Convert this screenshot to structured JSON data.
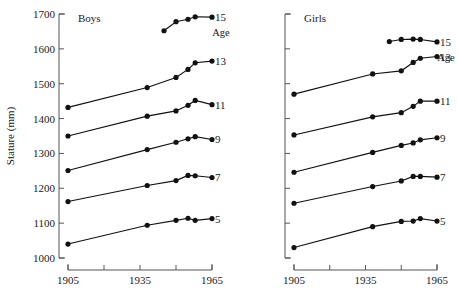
{
  "figure": {
    "y_axis_title": "Stature (mm)",
    "age_header": "Age"
  },
  "chart_data": {
    "type": "line",
    "xlabel": "",
    "ylabel": "Stature (mm)",
    "xlim": [
      1900,
      1968
    ],
    "ylim": [
      1000,
      1700
    ],
    "yticks": [
      1000,
      1100,
      1200,
      1300,
      1400,
      1500,
      1600,
      1700
    ],
    "ytick_labels": [
      "1000",
      "1100",
      "1200",
      "1300",
      "1400",
      "1500",
      "1600",
      "1700"
    ],
    "xticks": [
      1905,
      1920,
      1935,
      1950,
      1965
    ],
    "xtick_labels": [
      "1905",
      "",
      "1935",
      "",
      "1965"
    ],
    "grid": false,
    "legend_position": "right-of-series (age labels at line ends)",
    "panels": [
      {
        "name": "boys",
        "title": "Boys",
        "series": [
          {
            "name": "15",
            "age_label": "15",
            "x": [
              1945,
              1950,
              1955,
              1958,
              1965
            ],
            "y": [
              1652,
              1678,
              1685,
              1692,
              1691
            ]
          },
          {
            "name": "13",
            "age_label": "13",
            "x": [
              1905,
              1938,
              1950,
              1955,
              1958,
              1965
            ],
            "y": [
              1432,
              1489,
              1518,
              1541,
              1560,
              1565
            ]
          },
          {
            "name": "11",
            "age_label": "11",
            "x": [
              1905,
              1938,
              1950,
              1955,
              1958,
              1965
            ],
            "y": [
              1350,
              1407,
              1422,
              1438,
              1452,
              1440
            ]
          },
          {
            "name": "9",
            "age_label": "9",
            "x": [
              1905,
              1938,
              1950,
              1955,
              1958,
              1965
            ],
            "y": [
              1251,
              1311,
              1332,
              1342,
              1348,
              1340
            ]
          },
          {
            "name": "7",
            "age_label": "7",
            "x": [
              1905,
              1938,
              1950,
              1955,
              1958,
              1965
            ],
            "y": [
              1162,
              1208,
              1222,
              1237,
              1236,
              1231
            ]
          },
          {
            "name": "5",
            "age_label": "5",
            "x": [
              1905,
              1938,
              1950,
              1955,
              1958,
              1965
            ],
            "y": [
              1040,
              1094,
              1108,
              1114,
              1108,
              1113
            ]
          }
        ]
      },
      {
        "name": "girls",
        "title": "Girls",
        "series": [
          {
            "name": "15",
            "age_label": "15",
            "x": [
              1945,
              1950,
              1955,
              1958,
              1965
            ],
            "y": [
              1621,
              1627,
              1628,
              1627,
              1620
            ]
          },
          {
            "name": "13",
            "age_label": "13",
            "x": [
              1905,
              1938,
              1950,
              1955,
              1958,
              1965
            ],
            "y": [
              1470,
              1528,
              1537,
              1561,
              1573,
              1578
            ]
          },
          {
            "name": "11",
            "age_label": "11",
            "x": [
              1905,
              1938,
              1950,
              1955,
              1958,
              1965
            ],
            "y": [
              1353,
              1405,
              1417,
              1435,
              1450,
              1450
            ]
          },
          {
            "name": "9",
            "age_label": "9",
            "x": [
              1905,
              1938,
              1950,
              1955,
              1958,
              1965
            ],
            "y": [
              1246,
              1303,
              1323,
              1330,
              1339,
              1345
            ]
          },
          {
            "name": "7",
            "age_label": "7",
            "x": [
              1905,
              1938,
              1950,
              1955,
              1958,
              1965
            ],
            "y": [
              1157,
              1205,
              1221,
              1234,
              1234,
              1232
            ]
          },
          {
            "name": "5",
            "age_label": "5",
            "x": [
              1905,
              1938,
              1950,
              1955,
              1958,
              1965
            ],
            "y": [
              1030,
              1090,
              1105,
              1106,
              1113,
              1106
            ]
          }
        ]
      }
    ]
  }
}
